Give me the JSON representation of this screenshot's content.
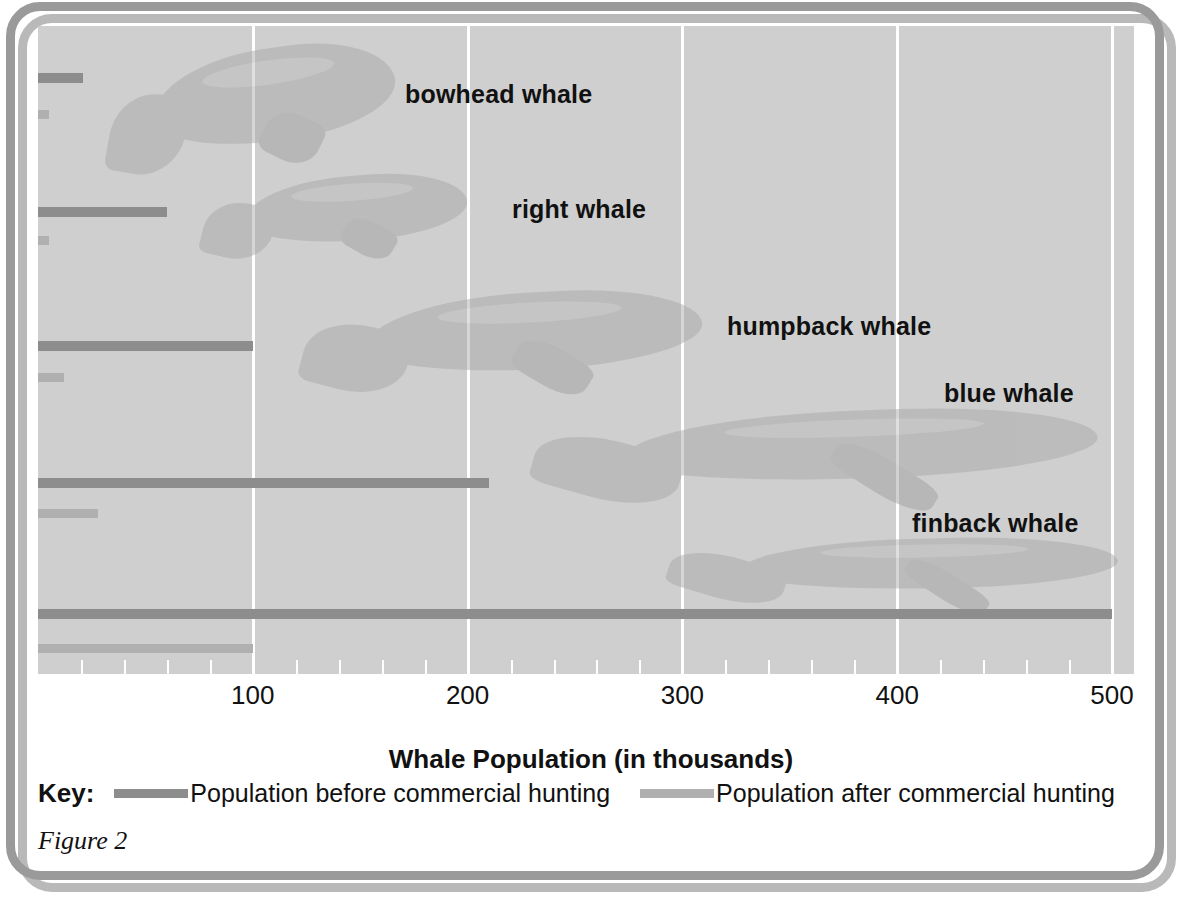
{
  "figure": {
    "caption": "Figure 2",
    "axis_title": "Whale Population (in thousands)"
  },
  "key": {
    "title": "Key:",
    "before_label": "Population before commercial hunting",
    "after_label": "Population after commercial hunting",
    "before_color": "#8d8d8d",
    "after_color": "#b0b0b0"
  },
  "colors": {
    "plot_background": "#cfcfcf",
    "gridline": "#ffffff",
    "frame": "#9a9a9a",
    "text": "#111111"
  },
  "chart_data": {
    "type": "bar",
    "orientation": "horizontal",
    "title": "",
    "xlabel": "Whale Population (in thousands)",
    "ylabel": "",
    "xlim": [
      0,
      500
    ],
    "xticks": [
      100,
      200,
      300,
      400,
      500
    ],
    "xtick_labels": [
      "100",
      "200",
      "300",
      "400",
      "500"
    ],
    "minor_tick_step": 20,
    "grid": true,
    "grid_axis": "x",
    "legend_position": "below-axis",
    "categories": [
      "bowhead whale",
      "right whale",
      "humpback whale",
      "blue whale",
      "finback whale"
    ],
    "series": [
      {
        "name": "Population before commercial hunting",
        "color": "#8d8d8d",
        "values": [
          21,
          60,
          100,
          210,
          500
        ]
      },
      {
        "name": "Population after commercial hunting",
        "color": "#b0b0b0",
        "values": [
          5,
          5,
          12,
          28,
          100
        ]
      }
    ]
  },
  "species": [
    {
      "label": "bowhead whale",
      "label_x": 405,
      "label_y": 80,
      "before": 21,
      "after": 5,
      "before_y": 73,
      "after_y": 110
    },
    {
      "label": "right whale",
      "label_x": 512,
      "label_y": 195,
      "before": 60,
      "after": 5,
      "before_y": 207,
      "after_y": 236
    },
    {
      "label": "humpback whale",
      "label_x": 727,
      "label_y": 312,
      "before": 100,
      "after": 12,
      "before_y": 341,
      "after_y": 373
    },
    {
      "label": "blue whale",
      "label_x": 944,
      "label_y": 379,
      "before": 210,
      "after": 28,
      "before_y": 478,
      "after_y": 509
    },
    {
      "label": "finback whale",
      "label_x": 912,
      "label_y": 509,
      "before": 500,
      "after": 100,
      "before_y": 609,
      "after_y": 644
    }
  ]
}
